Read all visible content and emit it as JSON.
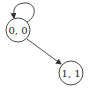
{
  "diagram": {
    "type": "state-graph",
    "nodes": [
      {
        "id": "n00",
        "label": "0, 0",
        "cx": 18,
        "cy": 30,
        "r": 12
      },
      {
        "id": "n11",
        "label": "1, 1",
        "cx": 71,
        "cy": 73,
        "r": 12
      }
    ],
    "edges": [
      {
        "from": "n00",
        "to": "n00",
        "kind": "self-loop"
      },
      {
        "from": "n00",
        "to": "n11",
        "kind": "directed"
      }
    ],
    "colors": {
      "stroke": "#333333",
      "background": "#ffffff"
    }
  }
}
